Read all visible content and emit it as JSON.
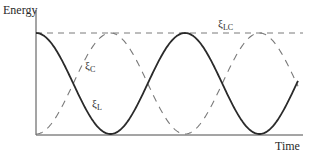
{
  "figure": {
    "y_axis_label": "Energy",
    "x_axis_label": "Time",
    "labels": {
      "xi_c": {
        "symbol": "ξ",
        "sub": "C"
      },
      "xi_l": {
        "symbol": "ξ",
        "sub": "L"
      },
      "xi_lc": {
        "symbol": "ξ",
        "sub": "LC"
      }
    },
    "colors": {
      "solid_curve": "#2a2a2a",
      "dashed_curve": "#7a7a7a",
      "axes": "#4a4a4a"
    }
  },
  "chart_data": {
    "type": "line",
    "title": "",
    "xlabel": "Time",
    "ylabel": "Energy",
    "series": [
      {
        "name": "ξ_L (inductor energy)",
        "style": "solid",
        "shape": "cos^2",
        "x": [
          0,
          0.5,
          1.0,
          1.5,
          2.0,
          2.5
        ],
        "values": [
          1,
          0,
          1,
          0,
          1,
          0
        ]
      },
      {
        "name": "ξ_C (capacitor energy)",
        "style": "dashed",
        "shape": "sin^2",
        "x": [
          0,
          0.5,
          1.0,
          1.5,
          2.0,
          2.5
        ],
        "values": [
          0,
          1,
          0,
          1,
          0,
          1
        ]
      },
      {
        "name": "ξ_LC (total energy)",
        "style": "dashed",
        "shape": "constant",
        "x": [
          0,
          2.5
        ],
        "values": [
          1,
          1
        ]
      }
    ],
    "ylim": [
      0,
      1
    ],
    "grid": false,
    "legend": "inline labels"
  }
}
